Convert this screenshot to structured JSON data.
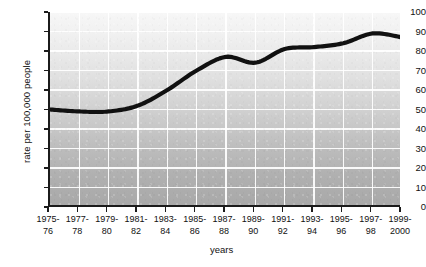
{
  "chart_data": {
    "type": "line",
    "title": "",
    "xlabel": "years",
    "ylabel": "rate per 100,000 people",
    "categories": [
      "1975-76",
      "1977-78",
      "1979-80",
      "1981-82",
      "1983-84",
      "1985-86",
      "1987-88",
      "1989-90",
      "1991-92",
      "1993-94",
      "1995-96",
      "1997-98",
      "1999-2000"
    ],
    "category_lines": [
      [
        "1975-",
        "76"
      ],
      [
        "1977-",
        "78"
      ],
      [
        "1979-",
        "80"
      ],
      [
        "1981-",
        "82"
      ],
      [
        "1983-",
        "84"
      ],
      [
        "1985-",
        "86"
      ],
      [
        "1987-",
        "88"
      ],
      [
        "1989-",
        "90"
      ],
      [
        "1991-",
        "92"
      ],
      [
        "1993-",
        "94"
      ],
      [
        "1995-",
        "96"
      ],
      [
        "1997-",
        "98"
      ],
      [
        "1999-",
        "2000"
      ]
    ],
    "values": [
      50,
      49,
      49,
      52,
      60,
      70,
      77,
      74,
      81,
      82,
      84,
      89,
      87
    ],
    "ylim": [
      0,
      100
    ],
    "ytick_values": [
      0,
      10,
      20,
      30,
      40,
      50,
      60,
      70,
      80,
      90,
      100
    ],
    "ytick_labels": [
      "0",
      "10",
      "20",
      "30",
      "40",
      "50",
      "60",
      "70",
      "80",
      "90",
      "100"
    ],
    "grid": true,
    "legend": "none",
    "series_color": "#111111",
    "plot_background_top": "#f7f7f7",
    "plot_background_bottom": "#a9a9a9",
    "gridline_color": "#ffffff",
    "axis_color": "#1b1b1b"
  }
}
